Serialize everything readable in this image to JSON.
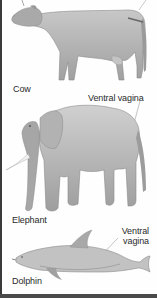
{
  "figure": {
    "panels": [
      {
        "animal": "Cow",
        "label": "Cow",
        "annotation": null
      },
      {
        "animal": "Elephant",
        "label": "Elephant",
        "annotation": "Ventral vagina"
      },
      {
        "animal": "Dolphin",
        "label": "Dolphin",
        "annotation_line1": "Ventral",
        "annotation_line2": "vagina"
      }
    ]
  },
  "colors": {
    "border": "#3a3a3a",
    "animal_fill": "#b5b5b5",
    "animal_shade": "#8c8c8c",
    "label_text": "#2a2a2a",
    "leader_line": "#9a9a9a"
  }
}
